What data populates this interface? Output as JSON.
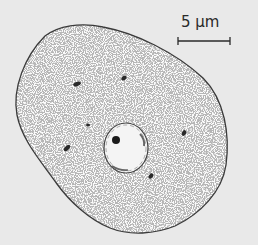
{
  "figure": {
    "colors": {
      "background": "#e9e9e9",
      "cytoplasm": "#fbfbfb",
      "outline": "#3a3a3a",
      "stipple": "#8a8a8a",
      "organelle": "#2a2a2a",
      "nucleolus": "#1a1a1a"
    },
    "scale_bar": {
      "label": "5 μm"
    },
    "organelles": [
      {
        "cx": 77,
        "cy": 84,
        "rx": 4,
        "ry": 2,
        "rot": -20
      },
      {
        "cx": 124,
        "cy": 78,
        "rx": 3,
        "ry": 2,
        "rot": -35
      },
      {
        "cx": 67,
        "cy": 148,
        "rx": 4,
        "ry": 2,
        "rot": -45
      },
      {
        "cx": 184,
        "cy": 133,
        "rx": 3,
        "ry": 2,
        "rot": -60
      },
      {
        "cx": 151,
        "cy": 176,
        "rx": 3,
        "ry": 2,
        "rot": -50
      },
      {
        "cx": 88,
        "cy": 125,
        "rx": 2,
        "ry": 1.5,
        "rot": 0
      }
    ],
    "nucleus": {
      "cx": 126,
      "cy": 148,
      "rx": 22,
      "ry": 25
    },
    "nucleolus": {
      "cx": 116,
      "cy": 140,
      "r": 4
    }
  }
}
